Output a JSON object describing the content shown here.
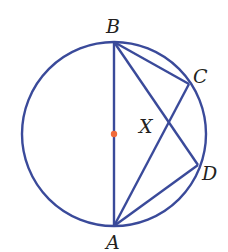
{
  "diagram": {
    "type": "circle-geometry",
    "colors": {
      "stroke": "#3a4a9a",
      "center_dot": "#f06a3a",
      "label": "#231f20"
    },
    "circle": {
      "cx": 114,
      "cy": 134,
      "r": 92
    },
    "points": {
      "B": {
        "label": "B",
        "x": 114,
        "y": 42
      },
      "A": {
        "label": "A",
        "x": 114,
        "y": 226
      },
      "C": {
        "label": "C",
        "x": 189,
        "y": 84
      },
      "D": {
        "label": "D",
        "x": 198,
        "y": 165
      },
      "X": {
        "label": "X",
        "x": 169,
        "y": 128
      }
    },
    "segments": [
      "BA",
      "BC",
      "BD",
      "AC",
      "AD"
    ]
  }
}
